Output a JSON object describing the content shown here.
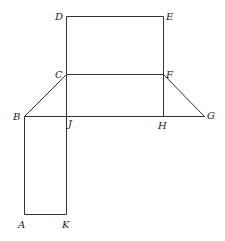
{
  "diagram": {
    "type": "geometric-figure",
    "colors": {
      "line": "#333333",
      "label": "#222222",
      "background": "#ffffff"
    },
    "points": {
      "A": {
        "x": 24,
        "y": 214
      },
      "B": {
        "x": 24,
        "y": 116
      },
      "C": {
        "x": 66,
        "y": 74
      },
      "D": {
        "x": 66,
        "y": 16
      },
      "E": {
        "x": 163,
        "y": 16
      },
      "F": {
        "x": 163,
        "y": 74
      },
      "G": {
        "x": 204,
        "y": 116
      },
      "H": {
        "x": 163,
        "y": 116
      },
      "J": {
        "x": 66,
        "y": 116
      },
      "K": {
        "x": 66,
        "y": 214
      }
    },
    "labels": [
      {
        "text": "D",
        "x": 55,
        "y": 20
      },
      {
        "text": "E",
        "x": 166,
        "y": 20
      },
      {
        "text": "C",
        "x": 55,
        "y": 78
      },
      {
        "text": "F",
        "x": 166,
        "y": 78
      },
      {
        "text": "B",
        "x": 13,
        "y": 120
      },
      {
        "text": "J",
        "x": 68,
        "y": 127
      },
      {
        "text": "H",
        "x": 158,
        "y": 129
      },
      {
        "text": "G",
        "x": 207,
        "y": 119
      },
      {
        "text": "A",
        "x": 18,
        "y": 228
      },
      {
        "text": "K",
        "x": 62,
        "y": 228
      }
    ],
    "segments": [
      {
        "from": "D",
        "to": "E"
      },
      {
        "from": "E",
        "to": "F"
      },
      {
        "from": "D",
        "to": "C"
      },
      {
        "from": "C",
        "to": "F"
      },
      {
        "from": "C",
        "to": "B"
      },
      {
        "from": "F",
        "to": "G"
      },
      {
        "from": "B",
        "to": "G"
      },
      {
        "from": "C",
        "to": "J"
      },
      {
        "from": "F",
        "to": "H"
      },
      {
        "from": "B",
        "to": "A"
      },
      {
        "from": "A",
        "to": "K"
      },
      {
        "from": "K",
        "to": "J"
      }
    ]
  }
}
